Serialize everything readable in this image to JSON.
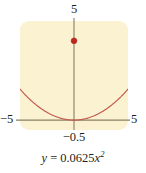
{
  "figure": {
    "caption": "y = 0.0625x²",
    "caption_parts": {
      "lhs": "y",
      "equals": "=",
      "coefficient": "0.0625",
      "variable": "x",
      "exponent": "2"
    },
    "panel_color": "#FBF2D2",
    "curve_color": "#C2584C",
    "axis_color": "#8A7F63",
    "point_color": "#C0251E",
    "text_color": "#231F20"
  },
  "labels": {
    "y_max": "5",
    "x_min": "−5",
    "x_max": "5",
    "vertex_x": "−0.5"
  },
  "chart_data": {
    "type": "line",
    "title": "",
    "subtitle": "",
    "xlabel": "",
    "ylabel": "",
    "equation": "y = 0.0625x²",
    "coefficient": 0.0625,
    "xlim": [
      -5,
      5
    ],
    "ylim": [
      -0.5,
      5
    ],
    "grid": false,
    "legend": null,
    "xticks": [
      "−5",
      "5"
    ],
    "yticks": [
      "5"
    ],
    "xtick_values": [
      -5,
      5
    ],
    "ytick_values": [
      5
    ],
    "extra_tick_labels": [
      {
        "text": "−0.5",
        "axis": "y",
        "position": "below-x-axis",
        "value": -0.5
      }
    ],
    "series": [
      {
        "name": "y = 0.0625x²",
        "color": "#C2584C",
        "x": [
          -5,
          -4.5,
          -4,
          -3.5,
          -3,
          -2.5,
          -2,
          -1.5,
          -1,
          -0.5,
          0,
          0.5,
          1,
          1.5,
          2,
          2.5,
          3,
          3.5,
          4,
          4.5,
          5
        ],
        "y": [
          1.5625,
          1.2656,
          1.0,
          0.7656,
          0.5625,
          0.3906,
          0.25,
          0.1406,
          0.0625,
          0.0156,
          0.0,
          0.0156,
          0.0625,
          0.1406,
          0.25,
          0.3906,
          0.5625,
          0.7656,
          1.0,
          1.2656,
          1.5625
        ]
      }
    ],
    "points": [
      {
        "name": "marked-point",
        "x": 0,
        "y": 4.0,
        "color": "#C0251E",
        "marker": "circle"
      }
    ]
  }
}
